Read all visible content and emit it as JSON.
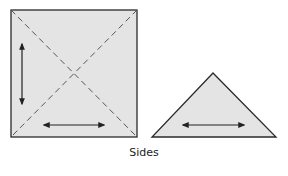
{
  "diagram": {
    "caption": "Sides",
    "colors": {
      "fill": "#e4e4e4",
      "stroke": "#2a2a2a",
      "dashed": "#555555",
      "arrow": "#222222"
    },
    "shapes": [
      {
        "name": "square",
        "fold_lines": "diagonals (dashed)",
        "arrows": [
          "vertical",
          "horizontal"
        ]
      },
      {
        "name": "triangle",
        "arrows": [
          "horizontal"
        ]
      }
    ]
  }
}
